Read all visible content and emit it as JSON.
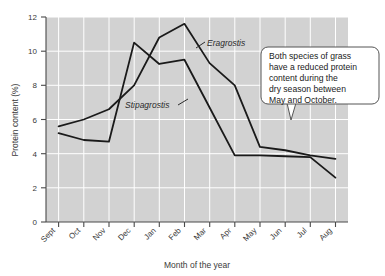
{
  "chart_data": {
    "type": "line",
    "title": "",
    "xlabel": "Month of the year",
    "ylabel": "Protein content (%)",
    "categories": [
      "Sept",
      "Oct",
      "Nov",
      "Dec",
      "Jan",
      "Feb",
      "Mar",
      "Apr",
      "May",
      "Jun",
      "Jul",
      "Aug"
    ],
    "ylim": [
      0,
      12
    ],
    "yticks": [
      0,
      2,
      4,
      6,
      8,
      10,
      12
    ],
    "grid": true,
    "legend_position": "inline-annotations",
    "plot_background": "#d2d2d2",
    "gridline_color": "#ffffff",
    "line_color": "#1a1a1a",
    "series": [
      {
        "name": "Eragrostis",
        "values": [
          5.6,
          6.0,
          6.6,
          8.0,
          10.8,
          11.6,
          9.3,
          8.0,
          4.4,
          4.2,
          3.9,
          3.7
        ]
      },
      {
        "name": "Stipagrostis",
        "values": [
          5.2,
          4.8,
          4.7,
          10.5,
          9.25,
          9.5,
          6.7,
          3.9,
          3.9,
          3.85,
          3.8,
          2.6
        ]
      }
    ],
    "annotations": [
      {
        "id": "callout",
        "text": "Both species of grass have a reduced protein content during the dry season between May and October.",
        "lines": [
          "Both species of grass",
          "have a reduced protein",
          "content during the",
          "dry season between",
          "May and October."
        ]
      }
    ]
  }
}
